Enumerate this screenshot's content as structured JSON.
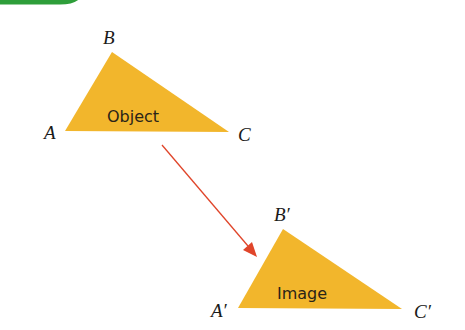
{
  "diagram": {
    "header_bar_color": "#2e9e3a",
    "triangle_color": "#f2b62c",
    "arrow_color": "#e0452a",
    "object": {
      "label": "Object",
      "vertices": {
        "A": "A",
        "B": "B",
        "C": "C"
      }
    },
    "image": {
      "label": "Image",
      "vertices": {
        "A": "A′",
        "B": "B′",
        "C": "C′"
      }
    }
  }
}
